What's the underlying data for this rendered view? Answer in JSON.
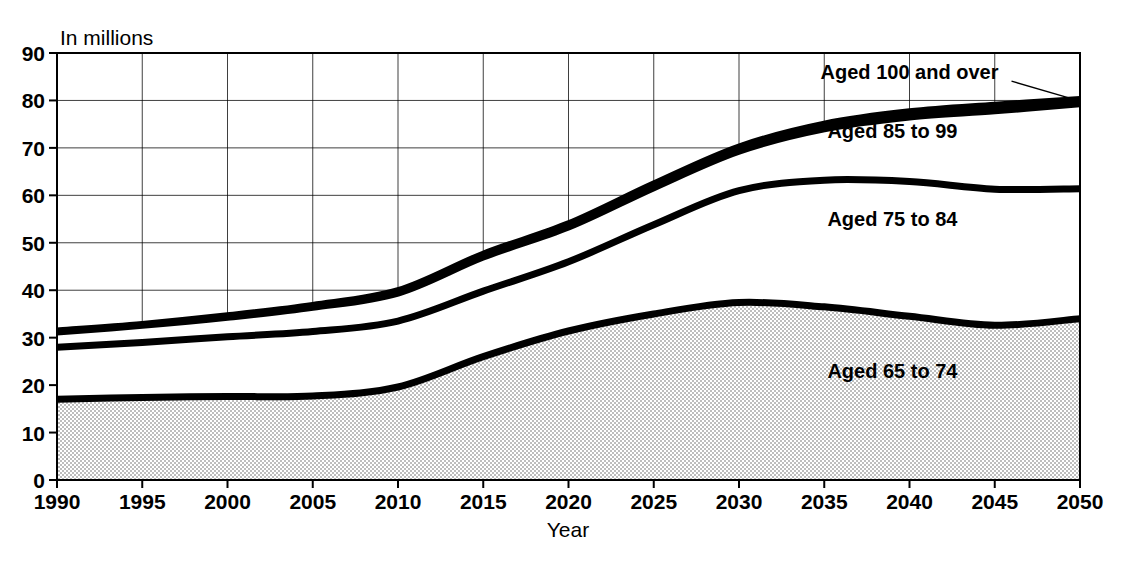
{
  "chart_data": {
    "type": "area",
    "title": "",
    "subtitle": "",
    "unit_label": "In millions",
    "xlabel": "Year",
    "ylabel": "",
    "grid": true,
    "legend_position": "inline-annotations",
    "xlim": [
      1990,
      2050
    ],
    "ylim": [
      0,
      90
    ],
    "ytick_step": 10,
    "xtick_step": 5,
    "x": [
      1990,
      1995,
      2000,
      2005,
      2010,
      2015,
      2020,
      2025,
      2030,
      2035,
      2040,
      2045,
      2050
    ],
    "yticks": [
      0,
      10,
      20,
      30,
      40,
      50,
      60,
      70,
      80,
      90
    ],
    "xticks": [
      1990,
      1995,
      2000,
      2005,
      2010,
      2015,
      2020,
      2025,
      2030,
      2035,
      2040,
      2045,
      2050
    ],
    "stacked": true,
    "cumulative_series": [
      {
        "name": "Aged 65 to 74",
        "label": "Aged 65 to 74",
        "cumulative_values": [
          17.0,
          17.4,
          17.6,
          17.7,
          19.6,
          26.0,
          31.4,
          35.0,
          37.4,
          36.5,
          34.5,
          32.6,
          34.0
        ],
        "fill": "#d6d6d6"
      },
      {
        "name": "Aged 75 to 84",
        "label": "Aged 75 to 84",
        "cumulative_values": [
          28.0,
          29.0,
          30.2,
          31.3,
          33.5,
          39.8,
          46.0,
          53.8,
          61.0,
          63.2,
          62.9,
          61.3,
          61.4
        ],
        "fill": "#ffffff"
      },
      {
        "name": "Aged 85 to 99",
        "label": "Aged 85 to 99",
        "cumulative_values": [
          31.2,
          32.6,
          34.3,
          36.4,
          39.4,
          47.0,
          53.3,
          61.6,
          69.3,
          74.0,
          76.5,
          77.8,
          79.3
        ],
        "fill": "#ffffff"
      },
      {
        "name": "Aged 100 and over",
        "label": "Aged 100 and over",
        "cumulative_values": [
          31.4,
          32.8,
          34.6,
          36.8,
          39.9,
          47.6,
          54.0,
          62.4,
          70.2,
          75.0,
          77.6,
          79.0,
          80.2
        ],
        "fill": "#ffffff"
      }
    ],
    "annotations": [
      {
        "text": "Aged 100 and over",
        "x": 2040,
        "y": 84.5,
        "leader": true
      },
      {
        "text": "Aged 85 to 99",
        "x": 2039,
        "y": 72.0,
        "leader": false
      },
      {
        "text": "Aged 75 to 84",
        "x": 2039,
        "y": 53.5,
        "leader": false
      },
      {
        "text": "Aged 65 to 74",
        "x": 2039,
        "y": 21.5,
        "leader": false
      }
    ],
    "colors": {
      "line": "#000000",
      "grid": "#000000",
      "shaded_band": "#d6d6d6",
      "background": "#ffffff"
    }
  }
}
